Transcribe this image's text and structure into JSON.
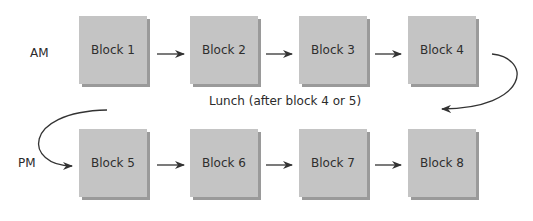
{
  "rows": {
    "am_label": "AM",
    "pm_label": "PM"
  },
  "blocks": [
    {
      "label": "Block 1"
    },
    {
      "label": "Block 2"
    },
    {
      "label": "Block 3"
    },
    {
      "label": "Block 4"
    },
    {
      "label": "Block 5"
    },
    {
      "label": "Block 6"
    },
    {
      "label": "Block 7"
    },
    {
      "label": "Block 8"
    }
  ],
  "lunch_note": "Lunch (after block 4 or 5)",
  "colors": {
    "block_fill": "#c4c4c4",
    "block_shadow": "#9a9a9a",
    "arrow": "#333333"
  }
}
